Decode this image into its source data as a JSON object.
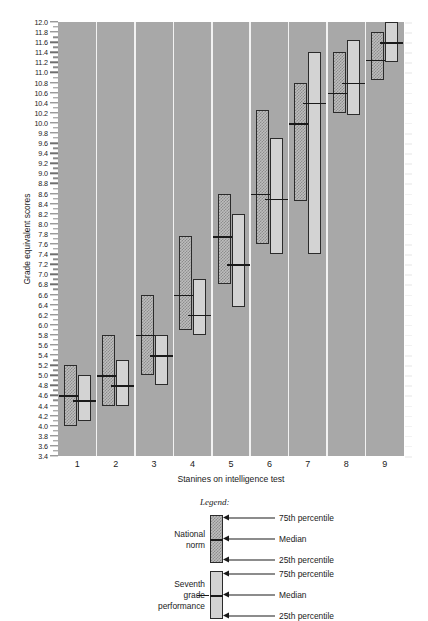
{
  "chart_data": {
    "type": "bar",
    "chart_kind": "box-percentile-range",
    "title": "",
    "xlabel": "Stanines on intelligence test",
    "ylabel": "Grade equivalent scores",
    "categories": [
      "1",
      "2",
      "3",
      "4",
      "5",
      "6",
      "7",
      "8",
      "9"
    ],
    "ylim": [
      3.4,
      12.0
    ],
    "ytick_step": 0.2,
    "ytick_labels": [
      "12.0",
      "11.8",
      "11.6",
      "11.4",
      "11.2",
      "11.0",
      "10.8",
      "10.6",
      "10.4",
      "10.2",
      "10.0",
      "9.8",
      "9.6",
      "9.4",
      "9.2",
      "9.0",
      "8.8",
      "8.6",
      "8.4",
      "8.2",
      "8.0",
      "7.8",
      "7.6",
      "7.4",
      "7.2",
      "7.0",
      "6.8",
      "6.6",
      "6.4",
      "6.2",
      "6.0",
      "5.8",
      "5.6",
      "5.4",
      "5.2",
      "5.0",
      "4.8",
      "4.6",
      "4.4",
      "4.2",
      "4.0",
      "3.8",
      "3.6",
      "3.4"
    ],
    "grid": false,
    "legend_position": "below-plot",
    "series": [
      {
        "name": "National norm",
        "style": "hatched",
        "p25": [
          4.0,
          4.4,
          5.0,
          5.9,
          6.8,
          7.6,
          8.45,
          10.2,
          10.85
        ],
        "median": [
          4.6,
          5.0,
          5.8,
          6.6,
          7.75,
          8.6,
          10.0,
          10.6,
          11.25
        ],
        "p75": [
          5.2,
          5.8,
          6.6,
          7.75,
          8.6,
          10.25,
          10.8,
          11.4,
          11.8
        ]
      },
      {
        "name": "Seventh grade performance",
        "style": "solid-light",
        "p25": [
          4.1,
          4.4,
          4.8,
          5.8,
          6.35,
          7.4,
          7.4,
          10.15,
          11.2
        ],
        "median": [
          4.5,
          4.8,
          5.4,
          6.2,
          7.2,
          8.5,
          10.4,
          10.8,
          11.6
        ],
        "p75": [
          5.0,
          5.3,
          5.8,
          6.9,
          8.2,
          9.7,
          11.4,
          11.65,
          12.0
        ]
      }
    ]
  },
  "axes": {
    "y_title": "Grade equivalent scores",
    "x_title": "Stanines on intelligence test"
  },
  "legend": {
    "title": "Legend:",
    "entries": [
      {
        "name": "National norm",
        "name_lines": [
          "National",
          "norm"
        ],
        "labels": [
          "75th percentile",
          "Median",
          "25th percentile"
        ]
      },
      {
        "name": "Seventh grade performance",
        "name_lines": [
          "Seventh",
          "grade",
          "performance"
        ],
        "labels": [
          "75th percentile",
          "Median",
          "25th percentile"
        ]
      }
    ]
  },
  "colors": {
    "plot_background": "#a8a8a8",
    "separator": "#f2f2f2",
    "norm_fill": "#bdbdbd",
    "norm_hatch": "#8d8d8d",
    "seventh_fill": "#d3d3d3",
    "outline": "#2b2b2b",
    "median_line": "#1a1a1a",
    "text": "#1a1a1a",
    "page_background": "#ffffff"
  }
}
